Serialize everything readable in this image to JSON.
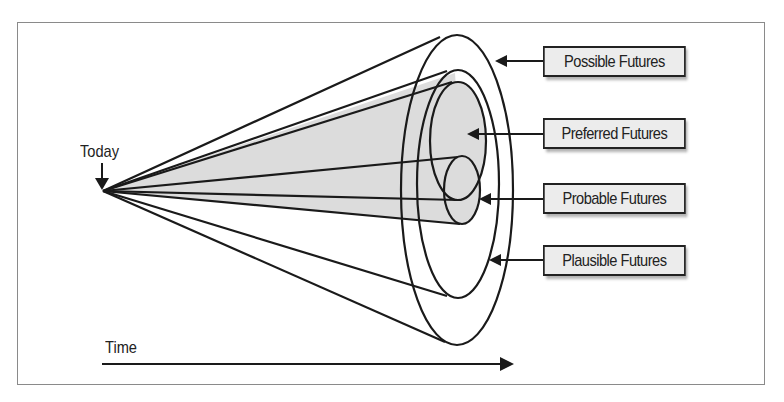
{
  "diagram": {
    "type": "futures-cone",
    "origin_label": "Today",
    "axis_label": "Time",
    "labels": [
      {
        "key": "possible",
        "text": "Possible Futures"
      },
      {
        "key": "preferred",
        "text": "Preferred Futures"
      },
      {
        "key": "probable",
        "text": "Probable Futures"
      },
      {
        "key": "plausible",
        "text": "Plausible Futures"
      }
    ],
    "colors": {
      "line": "#1a1a1a",
      "shaded_fill": "#dcdcdc",
      "label_fill": "#ececec",
      "frame": "#8a8a8a"
    }
  }
}
